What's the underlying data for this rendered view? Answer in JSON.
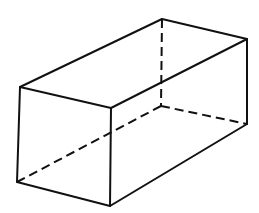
{
  "diagram": {
    "colors": {
      "line": "#111111",
      "background": "#ffffff"
    },
    "vertices": {
      "front_top_left": [
        20,
        87
      ],
      "front_top_right": [
        111,
        108
      ],
      "front_bottom_right": [
        110,
        206
      ],
      "front_bottom_left": [
        17,
        182
      ],
      "back_top_left": [
        162,
        19
      ],
      "back_top_right": [
        247,
        39
      ],
      "back_bottom_right": [
        247,
        124
      ],
      "back_bottom_left_hidden": [
        161,
        106
      ]
    },
    "visible_edges": 9,
    "hidden_edges": 3
  }
}
